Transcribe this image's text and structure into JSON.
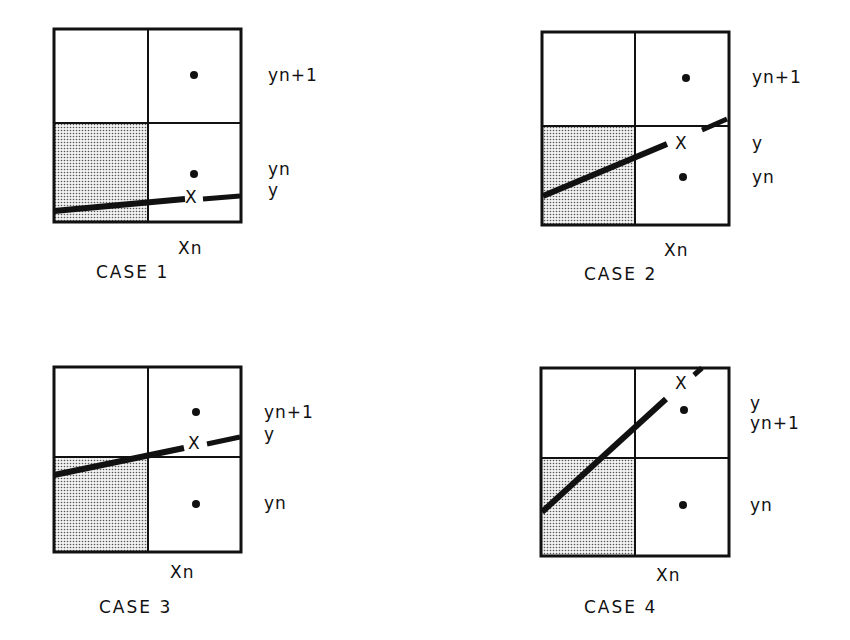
{
  "diagram": {
    "shaded_cell": "lower-left",
    "cases": [
      {
        "caption": "CASE 1",
        "x_label": "Xn",
        "labels": [
          {
            "text": "yn+1"
          },
          {
            "text": "yn"
          },
          {
            "text": "y"
          }
        ],
        "intersection_marker": "X"
      },
      {
        "caption": "CASE 2",
        "x_label": "Xn",
        "labels": [
          {
            "text": "yn+1"
          },
          {
            "text": "y"
          },
          {
            "text": "yn"
          }
        ],
        "intersection_marker": "X"
      },
      {
        "caption": "CASE 3",
        "x_label": "Xn",
        "labels": [
          {
            "text": "yn+1"
          },
          {
            "text": "y"
          },
          {
            "text": "yn"
          }
        ],
        "intersection_marker": "X"
      },
      {
        "caption": "CASE 4",
        "x_label": "Xn",
        "labels": [
          {
            "text": "y"
          },
          {
            "text": "yn+1"
          },
          {
            "text": "yn"
          }
        ],
        "intersection_marker": "X"
      }
    ]
  }
}
